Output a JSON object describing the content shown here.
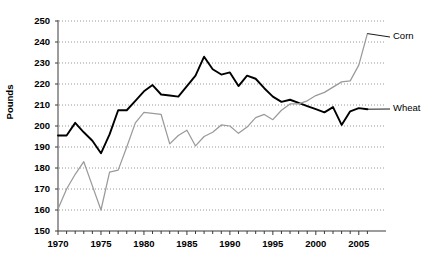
{
  "chart_data": {
    "type": "line",
    "title": "",
    "xlabel": "",
    "ylabel": "Pounds",
    "xlim": [
      1970,
      2006
    ],
    "ylim": [
      150,
      250
    ],
    "ytick_labels": [
      "150",
      "160",
      "170",
      "180",
      "190",
      "200",
      "210",
      "220",
      "230",
      "240",
      "250"
    ],
    "ytick_values": [
      150,
      160,
      170,
      180,
      190,
      200,
      210,
      220,
      230,
      240,
      250
    ],
    "xtick_labels": [
      "1970",
      "1975",
      "1980",
      "1985",
      "1990",
      "1995",
      "2000",
      "2005"
    ],
    "xtick_values": [
      1970,
      1975,
      1980,
      1985,
      1990,
      1995,
      2000,
      2005
    ],
    "grid": "horizontal-dotted",
    "legend": "inline-right-labels",
    "x": [
      1970,
      1971,
      1972,
      1973,
      1974,
      1975,
      1976,
      1977,
      1978,
      1979,
      1980,
      1981,
      1982,
      1983,
      1984,
      1985,
      1986,
      1987,
      1988,
      1989,
      1990,
      1991,
      1992,
      1993,
      1994,
      1995,
      1996,
      1997,
      1998,
      1999,
      2000,
      2001,
      2002,
      2003,
      2004,
      2005,
      2006
    ],
    "series": [
      {
        "name": "Wheat",
        "color": "#000000",
        "label_color": "#000000",
        "values": [
          195.5,
          195.5,
          201.5,
          197.0,
          193.0,
          187.0,
          196.0,
          207.5,
          207.5,
          212.0,
          216.5,
          219.5,
          215.0,
          214.5,
          214.0,
          219.0,
          224.0,
          233.0,
          227.0,
          224.5,
          225.5,
          219.0,
          224.0,
          222.5,
          218.0,
          214.0,
          211.5,
          212.5,
          211.0,
          209.5,
          208.0,
          206.5,
          209.0,
          200.5,
          207.0,
          208.5,
          208.0
        ]
      },
      {
        "name": "Corn",
        "color": "#9a9a9a",
        "label_color": "#000000",
        "values": [
          160.5,
          170.0,
          177.0,
          183.0,
          171.5,
          160.0,
          178.0,
          179.0,
          190.0,
          201.5,
          206.5,
          206.0,
          205.5,
          191.5,
          195.5,
          198.0,
          190.5,
          195.0,
          197.0,
          200.5,
          200.0,
          196.5,
          199.5,
          204.0,
          205.5,
          203.0,
          207.5,
          210.5,
          210.5,
          212.0,
          214.5,
          216.0,
          218.5,
          221.0,
          221.5,
          229.0,
          244.0
        ]
      }
    ],
    "annotations": [
      {
        "text": "Corn",
        "series": "Corn"
      },
      {
        "text": "Wheat",
        "series": "Wheat"
      }
    ]
  }
}
